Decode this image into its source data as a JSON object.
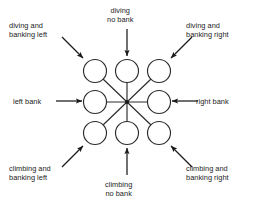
{
  "figure": {
    "background_color": "#ffffff",
    "stroke_color": "#1b1b1b",
    "text_color": "#1b1b1b"
  },
  "labels": {
    "diving_banking_left": {
      "line1": "diving and",
      "line2": "banking left"
    },
    "diving_no_bank": {
      "line1": "diving",
      "line2": "no bank"
    },
    "diving_banking_right": {
      "line1": "diving and",
      "line2": "banking right"
    },
    "left_bank": {
      "line1": "left bank",
      "line2": ""
    },
    "right_bank": {
      "line1": "right bank",
      "line2": ""
    },
    "climbing_banking_left": {
      "line1": "climbing and",
      "line2": "banking left"
    },
    "climbing_no_bank": {
      "line1": "climbing",
      "line2": "no bank"
    },
    "climbing_banking_right": {
      "line1": "climbing and",
      "line2": "banking right"
    }
  },
  "diagram": {
    "type": "radial-node-diagram",
    "hub": {
      "cx": 127,
      "cy": 102
    },
    "node_radius": 11.5,
    "nodes": [
      {
        "name": "node-diving-banking-left",
        "cx": 95,
        "cy": 71
      },
      {
        "name": "node-diving-no-bank",
        "cx": 127,
        "cy": 71
      },
      {
        "name": "node-diving-banking-right",
        "cx": 159,
        "cy": 71
      },
      {
        "name": "node-left-bank",
        "cx": 95,
        "cy": 102
      },
      {
        "name": "node-right-bank",
        "cx": 159,
        "cy": 102
      },
      {
        "name": "node-climbing-banking-left",
        "cx": 95,
        "cy": 133
      },
      {
        "name": "node-climbing-no-bank",
        "cx": 127,
        "cy": 133
      },
      {
        "name": "node-climbing-banking-right",
        "cx": 159,
        "cy": 133
      }
    ],
    "arrows": [
      {
        "name": "arrow-diving-banking-left",
        "x1": 62,
        "y1": 37,
        "x2": 83,
        "y2": 58
      },
      {
        "name": "arrow-diving-no-bank",
        "x1": 127,
        "y1": 29,
        "x2": 127,
        "y2": 56
      },
      {
        "name": "arrow-diving-banking-right",
        "x1": 192,
        "y1": 37,
        "x2": 171,
        "y2": 58
      },
      {
        "name": "arrow-left-bank",
        "x1": 56,
        "y1": 101,
        "x2": 82,
        "y2": 101
      },
      {
        "name": "arrow-right-bank",
        "x1": 198,
        "y1": 101,
        "x2": 172,
        "y2": 101
      },
      {
        "name": "arrow-climbing-banking-left",
        "x1": 62,
        "y1": 167,
        "x2": 83,
        "y2": 146
      },
      {
        "name": "arrow-climbing-no-bank",
        "x1": 127,
        "y1": 175,
        "x2": 127,
        "y2": 148
      },
      {
        "name": "arrow-climbing-banking-right",
        "x1": 192,
        "y1": 167,
        "x2": 171,
        "y2": 146
      }
    ],
    "spokes": [
      {
        "name": "spoke-up-left",
        "x2": 103,
        "y2": 79
      },
      {
        "name": "spoke-up",
        "x2": 127,
        "y2": 82
      },
      {
        "name": "spoke-up-right",
        "x2": 151,
        "y2": 79
      },
      {
        "name": "spoke-left",
        "x2": 106,
        "y2": 102
      },
      {
        "name": "spoke-right",
        "x2": 148,
        "y2": 102
      },
      {
        "name": "spoke-down-left",
        "x2": 103,
        "y2": 125
      },
      {
        "name": "spoke-down",
        "x2": 127,
        "y2": 122
      },
      {
        "name": "spoke-down-right",
        "x2": 151,
        "y2": 125
      }
    ]
  }
}
